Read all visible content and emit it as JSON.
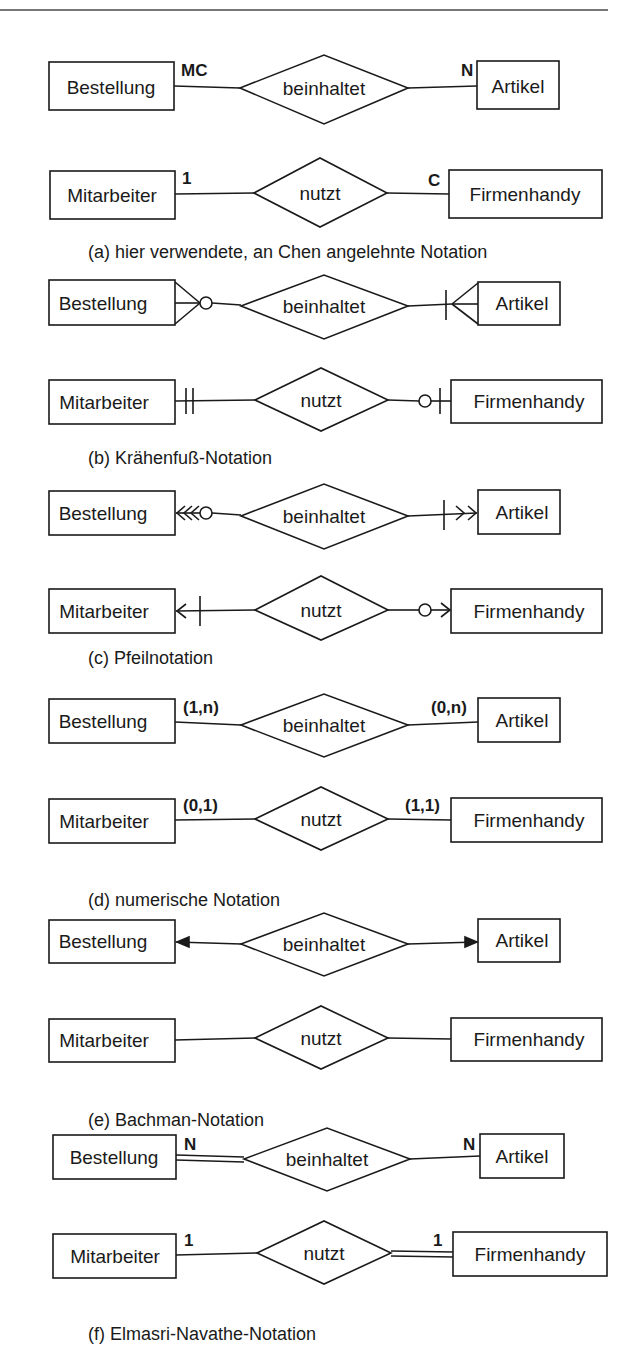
{
  "figure": {
    "sections": [
      {
        "id": "a",
        "caption": "(a) hier verwendete, an Chen angelehnte Notation",
        "rows": [
          {
            "left": "Bestellung",
            "relation": "beinhaltet",
            "right": "Artikel",
            "left_card": "MC",
            "right_card": "N"
          },
          {
            "left": "Mitarbeiter",
            "relation": "nutzt",
            "right": "Firmenhandy",
            "left_card": "1",
            "right_card": "C"
          }
        ]
      },
      {
        "id": "b",
        "caption": "(b) Krähenfuß-Notation",
        "rows": [
          {
            "left": "Bestellung",
            "relation": "beinhaltet",
            "right": "Artikel",
            "left_symbol": "crowfoot-zero-many",
            "right_symbol": "crowfoot-one-many"
          },
          {
            "left": "Mitarbeiter",
            "relation": "nutzt",
            "right": "Firmenhandy",
            "left_symbol": "exactly-one",
            "right_symbol": "zero-or-one"
          }
        ]
      },
      {
        "id": "c",
        "caption": "(c) Pfeilnotation",
        "rows": [
          {
            "left": "Bestellung",
            "relation": "beinhaltet",
            "right": "Artikel",
            "left_symbol": "double-arrow-circle",
            "right_symbol": "bar-double-arrow"
          },
          {
            "left": "Mitarbeiter",
            "relation": "nutzt",
            "right": "Firmenhandy",
            "left_symbol": "bar-single-arrow",
            "right_symbol": "circle-single-arrow"
          }
        ]
      },
      {
        "id": "d",
        "caption": "(d) numerische Notation",
        "rows": [
          {
            "left": "Bestellung",
            "relation": "beinhaltet",
            "right": "Artikel",
            "left_card": "(1,n)",
            "right_card": "(0,n)"
          },
          {
            "left": "Mitarbeiter",
            "relation": "nutzt",
            "right": "Firmenhandy",
            "left_card": "(0,1)",
            "right_card": "(1,1)"
          }
        ]
      },
      {
        "id": "e",
        "caption": "(e) Bachman-Notation",
        "rows": [
          {
            "left": "Bestellung",
            "relation": "beinhaltet",
            "right": "Artikel",
            "left_symbol": "arrowhead",
            "right_symbol": "arrowhead"
          },
          {
            "left": "Mitarbeiter",
            "relation": "nutzt",
            "right": "Firmenhandy",
            "left_symbol": "none",
            "right_symbol": "none"
          }
        ]
      },
      {
        "id": "f",
        "caption": "(f) Elmasri-Navathe-Notation",
        "rows": [
          {
            "left": "Bestellung",
            "relation": "beinhaltet",
            "right": "Artikel",
            "left_card": "N",
            "right_card": "N",
            "left_line": "double",
            "right_line": "single"
          },
          {
            "left": "Mitarbeiter",
            "relation": "nutzt",
            "right": "Firmenhandy",
            "left_card": "1",
            "right_card": "1",
            "left_line": "single",
            "right_line": "double"
          }
        ]
      }
    ],
    "colors": {
      "stroke": "#1a1a1a",
      "background": "#ffffff",
      "rule": "#777777"
    }
  }
}
